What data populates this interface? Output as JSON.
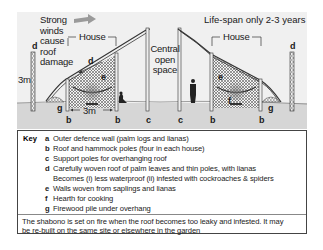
{
  "diagram": {
    "annotations": {
      "wind": "Strong\nwinds\ncause\nroof\ndamage",
      "wind_lines": [
        "Strong",
        "winds",
        "cause",
        "roof",
        "damage"
      ],
      "lifespan": "Life-span only 2-3 years",
      "house_left": "House",
      "house_right": "House",
      "central_lines": [
        "Central",
        "open",
        "space"
      ],
      "height_label": "3m",
      "width_label": "3m"
    },
    "letters": {
      "a": "a",
      "b": "b",
      "c": "c",
      "d": "d",
      "e": "e",
      "f": "f",
      "g": "g"
    },
    "colors": {
      "ground": "#d8d8d8",
      "sky": "#efefef",
      "wind_arrow": "#9a9a9a",
      "pole": "#e6e6e6",
      "ink": "#222222"
    }
  },
  "key": {
    "heading": "Key",
    "items": [
      {
        "letter": "a",
        "text": "Outer defence wall (palm logs and lianas)"
      },
      {
        "letter": "b",
        "text": "Roof and hammock poles (four in each house)"
      },
      {
        "letter": "c",
        "text": "Support poles for overhanging roof"
      },
      {
        "letter": "d",
        "text": "Carefully woven roof of palm leaves and thin poles, with lianas"
      },
      {
        "letter": "",
        "text": "Becomes (i) less waterproof (ii) infested with cockroaches & spiders"
      },
      {
        "letter": "e",
        "text": "Walls woven from saplings and lianas"
      },
      {
        "letter": "f",
        "text": "Hearth for cooking"
      },
      {
        "letter": "g",
        "text": "Firewood pile under overhang"
      }
    ],
    "note_lines": [
      "The shabono is set on fire when the roof becomes too leaky and infested. It may",
      "be re-built on the same site or elsewhere in the garden"
    ]
  }
}
